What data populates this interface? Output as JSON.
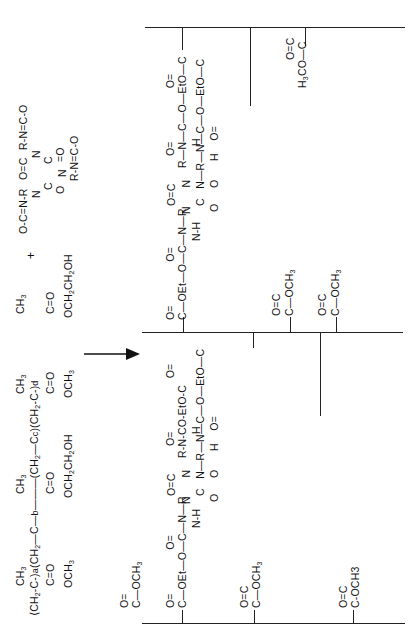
{
  "reaction": {
    "plus_sign": "+",
    "arrow": "reaction-arrow"
  },
  "isocyanurate_monomer": {
    "name": "triisocyanate (isocyanurate core)",
    "arm_top": "O-C=N-R",
    "ring_row1": "N-C",
    "ring_top_carbonyl": "O=C",
    "ring_row2": "N",
    "ring_n_center": "N-R-N=C-O",
    "ring_c_lower": "C=O",
    "ring_n_lower": "N-C",
    "ring_bottom_carbonyl": "C=O",
    "arm_bottom": "R-N=C-O",
    "labels": {
      "arm1": "O-C=N-R",
      "core_top": "O=C",
      "core_n1": "N",
      "core_n2": "N",
      "core_n3": "N",
      "core_c1": "C",
      "core_c2": "C",
      "core_c3": "C",
      "co1": "=O",
      "co2": "O",
      "arm2": "R-N=C-O",
      "arm3": "R-N=C-O"
    }
  },
  "copolymer": {
    "backbone": [
      "CH2-C",
      "CH2",
      "C",
      "CH2",
      "C",
      "CH2",
      "C"
    ],
    "methyls": [
      "CH3",
      "CH3",
      "CH3",
      "CH3"
    ],
    "carbonyls": [
      "C=O",
      "C=O",
      "C=O",
      "C=O"
    ],
    "esters": [
      "OCH3",
      "OCH2CH2OH",
      "OCH3",
      "OCH2CH2OH"
    ],
    "subscripts": [
      "a",
      "b",
      "c",
      "d"
    ]
  },
  "product_network": {
    "upper_chain_pendants": {
      "left_link_group": "O=C-OEt-O-C-N-R",
      "left_link_carbonyl": "O=C",
      "left_link_nh": "N-H",
      "ring": {
        "top_c": "O=C",
        "n_top": "N",
        "c_right": "C=O",
        "n_right": "N-R-N-C-O-EtO-C",
        "c_bottom": "C=O",
        "n_bottom": "N"
      },
      "right_link_group": "R-N-C-O-EtO-C=O",
      "right_link_nh": "N-H",
      "right_link_carbonyl": "O=C",
      "branch_group": "H-N-C-O-EtO-C",
      "branch_carbonyl": "O=C",
      "methyl_ester": "H3CO-C",
      "methyl_ester_carbonyl": "O=C"
    },
    "lower_chain_pendants": {
      "ester1": "C-OCH3",
      "ester1_carbonyl": "O=C",
      "ester2": "C-OCH3",
      "ester2_carbonyl": "O=C",
      "ester3": "C-OCH3",
      "ester3_carbonyl": "O=C",
      "link_group": "C-OEt-O-C-N-R",
      "link_carbonyl": "O=C",
      "link_nh": "N-H",
      "ring": {
        "top_c": "O=C",
        "n_top": "N",
        "c_right": "C=O",
        "n_right": "N-R",
        "c_bottom": "C=O",
        "n_bottom": "N"
      },
      "right_link_group": "R-N-CO-EtO-C",
      "right_link_nh": "N-H",
      "right_link_carbonyl": "O=C",
      "branch_group": "H-N-C-O-EtO-C",
      "branch_carbonyl": "O=C",
      "ester_bottom": "C-OCH3",
      "ester_bottom_carbonyl": "O=C"
    }
  }
}
